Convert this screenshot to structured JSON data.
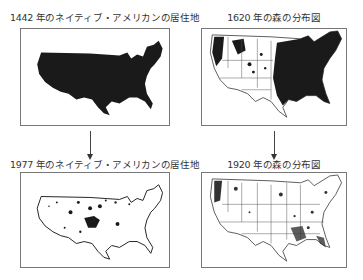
{
  "panels": {
    "top_left": {
      "title": "1442 年のネイティブ・アメリカンの居住地",
      "map": "us-native-american-territory-1442",
      "fill": "full"
    },
    "top_right": {
      "title": "1620 年の森の分布図",
      "map": "us-forest-distribution-1620",
      "fill": "dense-east"
    },
    "bottom_left": {
      "title": "1977 年のネイティブ・アメリカンの居住地",
      "map": "us-native-american-territory-1977",
      "fill": "scattered"
    },
    "bottom_right": {
      "title": "1920 年の森の分布図",
      "map": "us-forest-distribution-1920",
      "fill": "sparse"
    }
  },
  "arrows": [
    {
      "from": "top_left",
      "to": "bottom_left",
      "icon": "arrow-down-icon"
    },
    {
      "from": "top_right",
      "to": "bottom_right",
      "icon": "arrow-down-icon"
    }
  ],
  "colors": {
    "map_fill": "#1a1a1a",
    "border": "#777777",
    "text": "#333333"
  }
}
